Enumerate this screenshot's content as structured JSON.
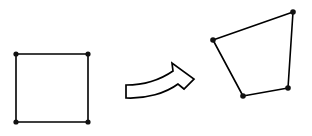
{
  "diagram": {
    "background_color": "#ffffff",
    "stroke_color": "#000000",
    "vertex_color": "#111111",
    "canvas": {
      "width": 312,
      "height": 136
    },
    "source_shape": {
      "name": "square",
      "label": "source square",
      "vertex_count": 4,
      "vertex_radius": 2.6,
      "points": "16,54 88,54 88,122 16,122",
      "vertices": [
        {
          "name": "top-left",
          "cx": 16,
          "cy": 54
        },
        {
          "name": "top-right",
          "cx": 88,
          "cy": 54
        },
        {
          "name": "bottom-right",
          "cx": 88,
          "cy": 122
        },
        {
          "name": "bottom-left",
          "cx": 16,
          "cy": 122
        }
      ]
    },
    "target_shape": {
      "name": "quadrilateral",
      "label": "transformed quadrilateral",
      "vertex_count": 4,
      "vertex_radius": 2.8,
      "points": "213,40 293,12 288,88 243,96",
      "vertices": [
        {
          "name": "left",
          "cx": 213,
          "cy": 40
        },
        {
          "name": "top-right",
          "cx": 293,
          "cy": 12
        },
        {
          "name": "bottom-right",
          "cx": 288,
          "cy": 88
        },
        {
          "name": "bottom-left",
          "cx": 243,
          "cy": 96
        }
      ]
    },
    "arrow": {
      "name": "curved transformation arrow",
      "direction": "right",
      "style": "outlined",
      "fill_color": "#ffffff",
      "path": "M 126 85 L 126 98 C 146 99 166 93 178 84 L 184 89 L 194 79 L 172 63 L 173 71 C 160 80 144 85 126 85 Z"
    }
  }
}
